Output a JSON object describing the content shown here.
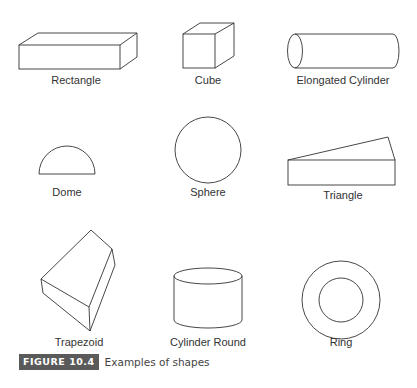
{
  "figure": {
    "number_label": "FIGURE 10.4",
    "caption": "Examples of shapes",
    "badge_color": "#5a5a5a"
  },
  "shapes": [
    {
      "name": "rectangle",
      "label": "Rectangle"
    },
    {
      "name": "cube",
      "label": "Cube"
    },
    {
      "name": "elongated-cylinder",
      "label": "Elongated Cylinder"
    },
    {
      "name": "dome",
      "label": "Dome"
    },
    {
      "name": "sphere",
      "label": "Sphere"
    },
    {
      "name": "triangle",
      "label": "Triangle"
    },
    {
      "name": "trapezoid",
      "label": "Trapezoid"
    },
    {
      "name": "cylinder-round",
      "label": "Cylinder Round"
    },
    {
      "name": "ring",
      "label": "Ring"
    }
  ]
}
